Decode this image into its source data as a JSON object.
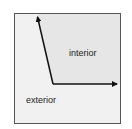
{
  "diagram": {
    "labels": {
      "interior": "interior",
      "exterior": "exterior"
    },
    "colors": {
      "background": "#f1f1f1",
      "interior_fill": "#e6e6e6",
      "arrow": "#111111",
      "frame": "#555555"
    },
    "arrows": [
      {
        "name": "vertical-arrow",
        "from": [
          53,
          84
        ],
        "to": [
          37,
          15
        ]
      },
      {
        "name": "horizontal-arrow",
        "from": [
          53,
          84
        ],
        "to": [
          119,
          84
        ]
      }
    ]
  }
}
